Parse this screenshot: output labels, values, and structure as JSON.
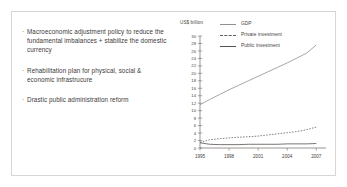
{
  "slide": {
    "bullets": [
      "Macroeconomic adjustment policy to reduce the fundamental imbalances + stabilize the domestic currency",
      "Rehabilitation plan for physical, social & economic infrastrucure",
      "Drastic public administration reform"
    ],
    "bullet_marker": "·"
  },
  "chart_data": {
    "type": "line",
    "title": "",
    "ylabel": "US$ billion",
    "xlabel": "",
    "x": [
      1995,
      1996,
      1997,
      1998,
      1999,
      2000,
      2001,
      2002,
      2003,
      2004,
      2005,
      2006,
      2007
    ],
    "xticks": [
      "1995",
      "1998",
      "2001",
      "2004",
      "2007"
    ],
    "xtick_values": [
      1995,
      1998,
      2001,
      2004,
      2007
    ],
    "xlim": [
      1995,
      2008
    ],
    "ylim": [
      0,
      30
    ],
    "yticks": [
      0,
      2,
      4,
      6,
      8,
      10,
      12,
      14,
      16,
      18,
      20,
      22,
      24,
      26,
      28,
      30
    ],
    "grid": false,
    "legend_position": "top-right",
    "series": [
      {
        "name": "GDP",
        "style": "solid",
        "color": "#8f8f8f",
        "values": [
          11.6,
          13.0,
          14.3,
          15.6,
          16.8,
          18.0,
          19.2,
          20.4,
          21.6,
          22.8,
          24.1,
          25.4,
          27.6
        ]
      },
      {
        "name": "Private investment",
        "style": "dotted",
        "color": "#5e5a57",
        "values": [
          1.5,
          2.2,
          2.5,
          2.7,
          2.9,
          3.0,
          3.2,
          3.5,
          3.8,
          4.1,
          4.4,
          4.9,
          5.6
        ]
      },
      {
        "name": "Public investment",
        "style": "solid",
        "color": "#55514e",
        "values": [
          1.4,
          1.0,
          0.9,
          0.9,
          0.9,
          1.0,
          1.0,
          1.0,
          1.0,
          1.1,
          1.1,
          1.1,
          1.2
        ]
      }
    ]
  }
}
